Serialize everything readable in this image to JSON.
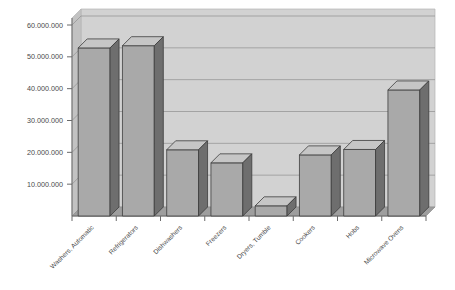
{
  "chart_data": {
    "type": "bar",
    "title": "",
    "subtitle": "",
    "xlabel": "",
    "ylabel": "",
    "categories": [
      "Washers, Automatic",
      "Refrigerators",
      "Dishwashers",
      "Freezers",
      "Dryers, Tumble",
      "Cookers",
      "Hobs",
      "Microwave Ovens"
    ],
    "values": [
      52800000,
      53500000,
      20800000,
      16700000,
      3200000,
      19200000,
      20900000,
      39600000
    ],
    "ylim": [
      0,
      60000000
    ],
    "yticks": [
      10000000,
      20000000,
      30000000,
      40000000,
      50000000,
      60000000
    ],
    "ytick_labels": [
      "10.000.000",
      "20.000.000",
      "30.000.000",
      "40.000.000",
      "50.000.000",
      "60.000.000"
    ],
    "grid": true,
    "legend": "none",
    "style": "3d-column",
    "label_rotation_deg": -45,
    "colors": {
      "bar_front": "#a9a9a9",
      "bar_side": "#6e6e6e",
      "bar_top": "#c6c6c6",
      "bar_outline": "#3c3c3c",
      "plot_back_wall": "#d2d2d2",
      "plot_side_wall": "#c2c2c2",
      "plot_floor": "#9e9e9e",
      "gridline": "#8f8f8f",
      "axis": "#6a6a6a",
      "text": "#4a4a4a",
      "page_background": "#ffffff"
    }
  }
}
